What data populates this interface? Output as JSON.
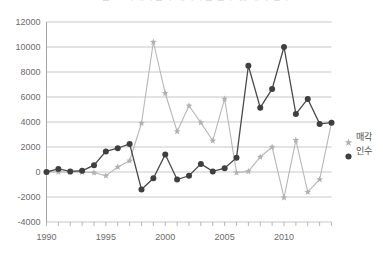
{
  "title": {
    "text": "그림  4.            국내기업의 해외기업 인수 및 매각 건수",
    "visible_note": "clipped at top edge"
  },
  "legend": {
    "position": "right",
    "entries": [
      {
        "label": "매각",
        "marker": "star",
        "color": "#b0b0b0"
      },
      {
        "label": "인수",
        "marker": "circle",
        "color": "#3f3f3f"
      }
    ]
  },
  "chart_data": {
    "type": "line",
    "title": "그림  4.            국내기업의 해외기업 인수 및 매각 건수",
    "xlabel": "",
    "ylabel": "",
    "xlim": [
      1990,
      2014
    ],
    "ylim": [
      -4000,
      12000
    ],
    "ytick_step": 2000,
    "yticks": [
      -4000,
      -2000,
      0,
      2000,
      4000,
      6000,
      8000,
      10000,
      12000
    ],
    "xticks": [
      1990,
      1995,
      2000,
      2005,
      2010
    ],
    "xtick_step": 5,
    "grid": "horizontal",
    "legend_position": "right",
    "x": [
      1990,
      1991,
      1992,
      1993,
      1994,
      1995,
      1996,
      1997,
      1998,
      1999,
      2000,
      2001,
      2002,
      2003,
      2004,
      2005,
      2006,
      2007,
      2008,
      2009,
      2010,
      2011,
      2012,
      2013,
      2014
    ],
    "series": [
      {
        "name": "매각",
        "color": "#b0b0b0",
        "marker": "star",
        "values": [
          0,
          0,
          0,
          0,
          -50,
          -300,
          400,
          900,
          3900,
          10400,
          6300,
          3250,
          5300,
          3950,
          2500,
          5850,
          -50,
          50,
          1200,
          2000,
          -2050,
          2550,
          -1600,
          -600,
          3950
        ]
      },
      {
        "name": "인수",
        "color": "#3f3f3f",
        "marker": "circle",
        "values": [
          0,
          250,
          50,
          100,
          550,
          1650,
          1900,
          2250,
          -1400,
          -500,
          1400,
          -600,
          -300,
          650,
          50,
          300,
          1150,
          8500,
          5150,
          6650,
          10000,
          4650,
          5850,
          3850,
          3950
        ]
      }
    ]
  },
  "axes": {
    "y_labels": [
      "12000",
      "10000",
      "8000",
      "6000",
      "4000",
      "2000",
      "0",
      "-2000",
      "-4000"
    ],
    "x_labels": [
      "1990",
      "1995",
      "2000",
      "2005",
      "2010"
    ]
  }
}
